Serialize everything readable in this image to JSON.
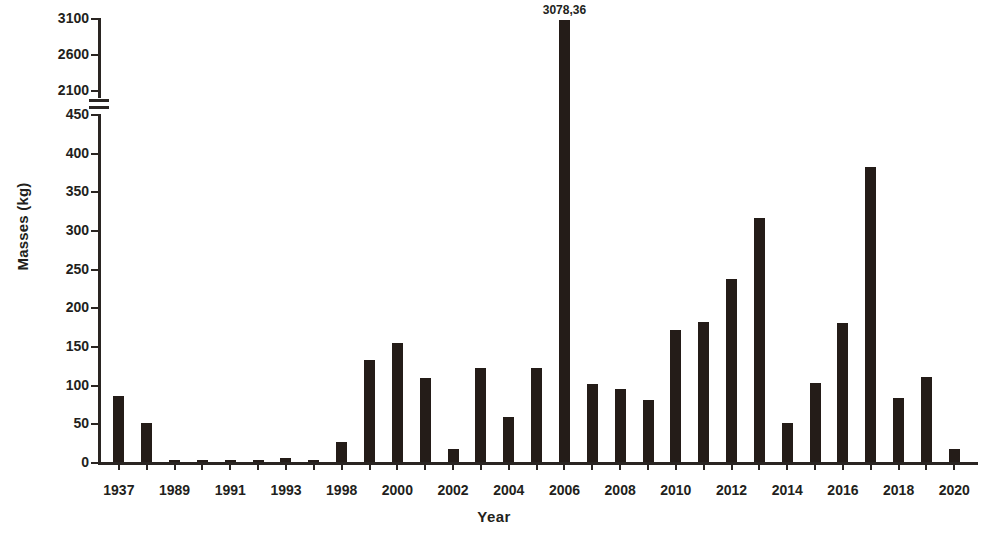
{
  "chart_data": {
    "type": "bar",
    "title": "",
    "xlabel": "Year",
    "ylabel": "Masses (kg)",
    "categories": [
      "1937",
      "1988",
      "1989",
      "1990",
      "1991",
      "1992",
      "1993",
      "1997",
      "1998",
      "1999",
      "2000",
      "2001",
      "2002",
      "2003",
      "2004",
      "2005",
      "2006",
      "2007",
      "2008",
      "2009",
      "2010",
      "2011",
      "2012",
      "2013",
      "2014",
      "2015",
      "2016",
      "2017",
      "2018",
      "2019",
      "2020"
    ],
    "tick_labels": [
      "1937",
      "",
      "1989",
      "",
      "1991",
      "",
      "1993",
      "",
      "1998",
      "",
      "2000",
      "",
      "2002",
      "",
      "2004",
      "",
      "2006",
      "",
      "2008",
      "",
      "2010",
      "",
      "2012",
      "",
      "2014",
      "",
      "2016",
      "",
      "2018",
      "",
      "2020"
    ],
    "values": [
      85,
      51,
      2,
      2,
      2,
      2,
      5,
      2,
      26,
      132,
      154,
      108,
      17,
      122,
      58,
      122,
      3078.36,
      101,
      95,
      80,
      171,
      181,
      237,
      316,
      51,
      102,
      180,
      382,
      83,
      110,
      17
    ],
    "bar_labels": [
      "",
      "",
      "",
      "",
      "",
      "",
      "",
      "",
      "",
      "",
      "",
      "",
      "",
      "",
      "",
      "",
      "3078,36",
      "",
      "",
      "",
      "",
      "",
      "",
      "",
      "",
      "",
      "",
      "",
      "",
      "",
      ""
    ],
    "ylim_lower": [
      0,
      450
    ],
    "ylim_upper": [
      2100,
      3100
    ],
    "yticks_lower": [
      0,
      50,
      100,
      150,
      200,
      250,
      300,
      350,
      400,
      450
    ],
    "yticks_upper": [
      2100,
      2600,
      3100
    ],
    "axis_break": true,
    "grid": false,
    "legend": "none",
    "bar_color": "#241c18",
    "axis_color": "#2a2522",
    "background_color": "#ffffff"
  }
}
